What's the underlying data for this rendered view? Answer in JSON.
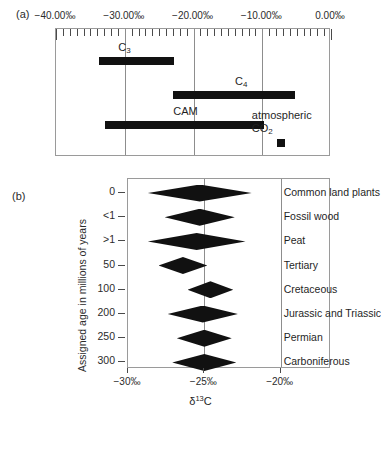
{
  "figure": {
    "panel_a_label": "(a)",
    "panel_b_label": "(b)"
  },
  "chart_data": [
    {
      "type": "bar",
      "panel": "(a)",
      "orientation": "horizontal-range",
      "title": "",
      "xlabel": "",
      "ylabel": "",
      "xlim": [
        -40,
        0
      ],
      "xunit": "‰",
      "grid": true,
      "minor_tick_step": 1,
      "major_tick_step": 10,
      "tick_labels": [
        "−40.00‰",
        "−30.00‰",
        "−20.00‰",
        "−10.00‰",
        "0.00‰"
      ],
      "tick_values": [
        -40,
        -30,
        -20,
        -10,
        0
      ],
      "gridline_values": [
        -30,
        -20,
        -10
      ],
      "items": [
        {
          "name": "C3",
          "label_main": "C",
          "label_sub": "3",
          "start": -33.8,
          "end": -22.8,
          "label_x": -29.5
        },
        {
          "name": "C4",
          "label_main": "C",
          "label_sub": "4",
          "start": -23.0,
          "end": -5.3,
          "label_x": -12.5
        },
        {
          "name": "CAM",
          "label_main": "CAM",
          "label_sub": "",
          "start": -32.9,
          "end": -9.8,
          "label_x": -21.5
        },
        {
          "name": "atmospheric CO2",
          "label_main": "atmospheric",
          "label_sub": "2",
          "label_main2": "CO",
          "marker": "square",
          "value": -7.3
        }
      ]
    },
    {
      "type": "scatter",
      "panel": "(b)",
      "marker": "diamond",
      "title": "",
      "xlabel": "δ13C",
      "ylabel": "Assigned age in millions of years",
      "xlim": [
        -30,
        -16.7
      ],
      "xunit": "‰",
      "x_tick_labels": [
        "−30‰",
        "−25‰",
        "−20‰"
      ],
      "x_tick_values": [
        -30,
        -25,
        -20
      ],
      "gridline_values": [
        -25,
        -20
      ],
      "y_tick_labels": [
        "0",
        "<1",
        ">1",
        "50",
        "100",
        "200",
        "250",
        "300"
      ],
      "points": [
        {
          "age_label": "0",
          "name": "Common land plants",
          "center": -25.3,
          "half_width": 3.4
        },
        {
          "age_label": "<1",
          "name": "Fossil wood",
          "center": -25.3,
          "half_width": 2.3
        },
        {
          "age_label": ">1",
          "name": "Peat",
          "center": -25.5,
          "half_width": 3.2
        },
        {
          "age_label": "50",
          "name": "Tertiary",
          "center": -26.4,
          "half_width": 1.6
        },
        {
          "age_label": "100",
          "name": "Cretaceous",
          "center": -24.6,
          "half_width": 1.5
        },
        {
          "age_label": "200",
          "name": "Jurassic and Triassic",
          "center": -25.1,
          "half_width": 2.3
        },
        {
          "age_label": "250",
          "name": "Permian",
          "center": -25.0,
          "half_width": 1.8
        },
        {
          "age_label": "300",
          "name": "Carboniferous",
          "center": -25.0,
          "half_width": 2.1
        }
      ]
    }
  ],
  "colors": {
    "ink": "#111111",
    "frame": "#9a9a9a",
    "grid": "#8d8d8d",
    "text": "#2b2b2b"
  }
}
